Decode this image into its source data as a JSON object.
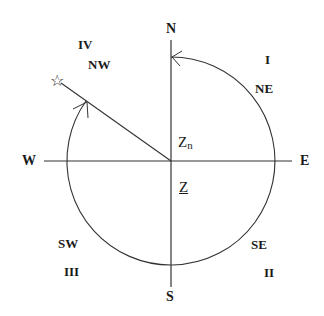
{
  "diagram": {
    "colors": {
      "line": "#333333",
      "text": "#1a1a1a",
      "background": "#ffffff"
    },
    "cardinals": {
      "north": "N",
      "south": "S",
      "east": "E",
      "west": "W"
    },
    "intercardinals": {
      "ne": "NE",
      "se": "SE",
      "sw": "SW",
      "nw": "NW"
    },
    "quadrants": {
      "q1": "I",
      "q2": "II",
      "q3": "III",
      "q4": "IV"
    },
    "labels": {
      "zn_main": "Z",
      "zn_sub": "n",
      "z_underlined": "Z"
    },
    "star_icon": "☆",
    "geometry": {
      "center": [
        171,
        161
      ],
      "radius": 104
    }
  }
}
